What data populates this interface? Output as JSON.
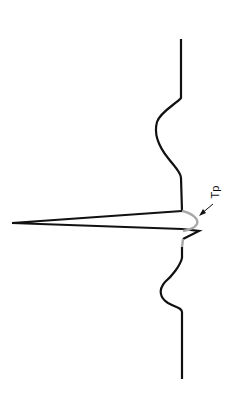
{
  "figure": {
    "type": "ECG waveform (single cardiac cycle, rotated 90°)",
    "orientation": "vertical, time runs bottom-to-top",
    "annotations": [
      {
        "id": "tp",
        "text": "Tp",
        "target": "atrial repolarization (Ta/Tp) segment, shown in gray",
        "arrow": true
      }
    ],
    "colors": {
      "trace": "#111111",
      "highlight_segment": "#a8a8a8",
      "background": "#ffffff"
    }
  }
}
